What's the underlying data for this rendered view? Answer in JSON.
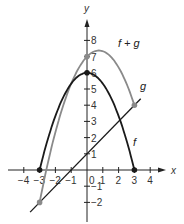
{
  "chart_data": {
    "type": "line",
    "title": "",
    "xlabel": "x",
    "ylabel": "y",
    "xlim": [
      -4.3,
      4.9
    ],
    "ylim": [
      -2.8,
      9.2
    ],
    "grid": false,
    "x_ticks": [
      -4,
      -3,
      -2,
      -1,
      0,
      1,
      2,
      3,
      4
    ],
    "x_tick_labels": [
      "−4",
      "−3",
      "−2",
      "−1",
      "0",
      "1",
      "2",
      "3",
      "4"
    ],
    "y_ticks": [
      -2,
      -1,
      1,
      2,
      3,
      4,
      5,
      6,
      7,
      8
    ],
    "y_tick_labels": [
      "−2",
      "−1",
      "1",
      "2",
      "3",
      "4",
      "5",
      "6",
      "7",
      "8"
    ],
    "series": [
      {
        "name": "f",
        "label": "f",
        "color": "#1a1a1a",
        "x": [
          -3,
          -2,
          -1,
          0,
          1,
          2,
          3
        ],
        "y": [
          0,
          3.33,
          5.33,
          6,
          5.33,
          3.33,
          0
        ]
      },
      {
        "name": "g",
        "label": "g",
        "color": "#1a1a1a",
        "x": [
          -3.6,
          -3,
          -1,
          0,
          1,
          2,
          3.4
        ],
        "y": [
          -2.6,
          -2,
          0,
          1,
          2,
          3,
          4.4
        ]
      },
      {
        "name": "f+g",
        "label": "f + g",
        "color": "#8a8a8a",
        "x": [
          -3,
          -2,
          -1,
          0,
          0.75,
          1,
          2,
          3
        ],
        "y": [
          -2,
          2.33,
          5.33,
          7,
          7.38,
          7.33,
          6.33,
          4
        ]
      }
    ],
    "points": [
      {
        "x": -3,
        "y": 0,
        "series": "f"
      },
      {
        "x": 3,
        "y": 0,
        "series": "f"
      },
      {
        "x": 0,
        "y": 6,
        "series": "f"
      },
      {
        "x": 0,
        "y": 7,
        "series": "f+g"
      },
      {
        "x": -3,
        "y": -2,
        "series": "f+g"
      },
      {
        "x": 3,
        "y": 4,
        "series": "f+g"
      }
    ]
  }
}
